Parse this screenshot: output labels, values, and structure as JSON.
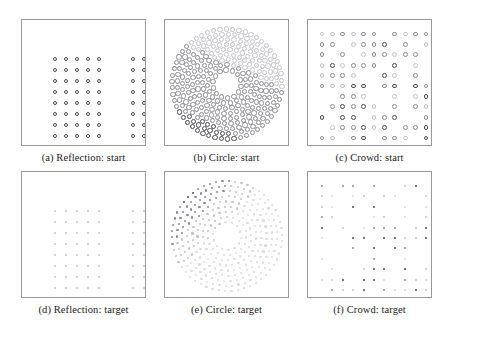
{
  "figure": {
    "layout": {
      "rows": 2,
      "cols": 3
    },
    "panel_size": {
      "w": 125,
      "h": 127
    },
    "row_gap": 8,
    "col_gap": 18,
    "margin_left": 21,
    "margin_top": 19,
    "caption_band_height": 20,
    "colors": {
      "panel_border": "#9a9a9a",
      "marker_dark": "#4a4a55",
      "marker_mid": "#8b8b96",
      "marker_light": "#c3c3cb",
      "marker_faint": "#dcdce2",
      "caption_text": "#222222",
      "background": "#ffffff"
    },
    "subfigures": [
      {
        "tag": "a",
        "name": "Reflection",
        "state": "start",
        "caption": "(a) Reflection: start"
      },
      {
        "tag": "b",
        "name": "Circle",
        "state": "start",
        "caption": "(b) Circle: start"
      },
      {
        "tag": "c",
        "name": "Crowd",
        "state": "start",
        "caption": "(c) Crowd: start"
      },
      {
        "tag": "d",
        "name": "Reflection",
        "state": "target",
        "caption": "(d) Reflection: target"
      },
      {
        "tag": "e",
        "name": "Circle",
        "state": "target",
        "caption": "(e) Circle: target"
      },
      {
        "tag": "f",
        "name": "Crowd",
        "state": "target",
        "caption": "(f) Crowd: target"
      }
    ]
  },
  "chart_data": {
    "type": "scatter",
    "title": "",
    "xlabel": "",
    "ylabel": "",
    "grid": false,
    "legend": "none",
    "panels": [
      {
        "id": "a",
        "caption": "(a) Reflection: start",
        "marker_radius": 2.3,
        "marker_style": "ring",
        "xlim": [
          0,
          125
        ],
        "ylim": [
          0,
          127
        ],
        "description": "Two identical 5-column x 9-row square lattices of dots, one left of centre and one right of centre, separated by an empty vertical gap.",
        "clusters": [
          {
            "name": "left-block",
            "cols": 5,
            "rows": 9,
            "x0": 33,
            "y0": 39,
            "dx": 11,
            "dy": 11,
            "shade": "marker_dark"
          },
          {
            "name": "right-block",
            "cols": 5,
            "rows": 9,
            "x0": 111,
            "y0": 39,
            "dx": 11,
            "dy": 11,
            "shade": "marker_dark"
          }
        ]
      },
      {
        "id": "b",
        "caption": "(b) Circle: start",
        "marker_radius": 2.6,
        "marker_style": "ring",
        "xlim": [
          0,
          125
        ],
        "ylim": [
          0,
          127
        ],
        "description": "Dots arranged on concentric rings forming a filled disc with a small hollow core; dot shade varies from light in the upper-left to dark in the lower area.",
        "disc": {
          "cx": 62,
          "cy": 64,
          "r_outer": 55,
          "r_inner": 9,
          "rings": 9,
          "ring_step": 5.6
        }
      },
      {
        "id": "c",
        "caption": "(c) Crowd: start",
        "marker_radius": 2.4,
        "marker_style": "ring",
        "xlim": [
          0,
          125
        ],
        "ylim": [
          0,
          127
        ],
        "description": "Sparse irregular occupancy of an 11x11 square lattice; roughly two thirds of the lattice sites carry a dot, leaving ragged gaps.",
        "lattice": {
          "cols": 11,
          "rows": 11,
          "x0": 14,
          "y0": 14,
          "dx": 10.4,
          "dy": 10.4,
          "fill_fraction": 0.66
        }
      },
      {
        "id": "d",
        "caption": "(d) Reflection: target",
        "marker_radius": 1.0,
        "marker_style": "dot",
        "xlim": [
          0,
          125
        ],
        "ylim": [
          0,
          127
        ],
        "description": "Same two 5x9 lattices as panel (a) but drawn with very small faint dots.",
        "clusters": [
          {
            "name": "left-block",
            "cols": 5,
            "rows": 9,
            "x0": 33,
            "y0": 39,
            "dx": 11,
            "dy": 11,
            "shade": "marker_light"
          },
          {
            "name": "right-block",
            "cols": 5,
            "rows": 9,
            "x0": 111,
            "y0": 39,
            "dx": 11,
            "dy": 11,
            "shade": "marker_light"
          }
        ]
      },
      {
        "id": "e",
        "caption": "(e) Circle: target",
        "marker_radius": 1.1,
        "marker_style": "dot",
        "xlim": [
          0,
          125
        ],
        "ylim": [
          0,
          127
        ],
        "description": "Same disc of concentric rings as panel (b) rendered with tiny dots; markers are darkest in the upper-left quadrant and fade to almost white on the right.",
        "disc": {
          "cx": 62,
          "cy": 64,
          "r_outer": 55,
          "r_inner": 9,
          "rings": 9,
          "ring_step": 5.6
        }
      },
      {
        "id": "f",
        "caption": "(f) Crowd: target",
        "marker_radius": 1.1,
        "marker_style": "dot",
        "xlim": [
          0,
          125
        ],
        "ylim": [
          0,
          127
        ],
        "description": "Same sparse 11x11 lattice occupancy as panel (c) rendered with tiny dots of mixed dark and very faint shades.",
        "lattice": {
          "cols": 11,
          "rows": 11,
          "x0": 14,
          "y0": 14,
          "dx": 10.4,
          "dy": 10.4,
          "fill_fraction": 0.66
        }
      }
    ]
  }
}
